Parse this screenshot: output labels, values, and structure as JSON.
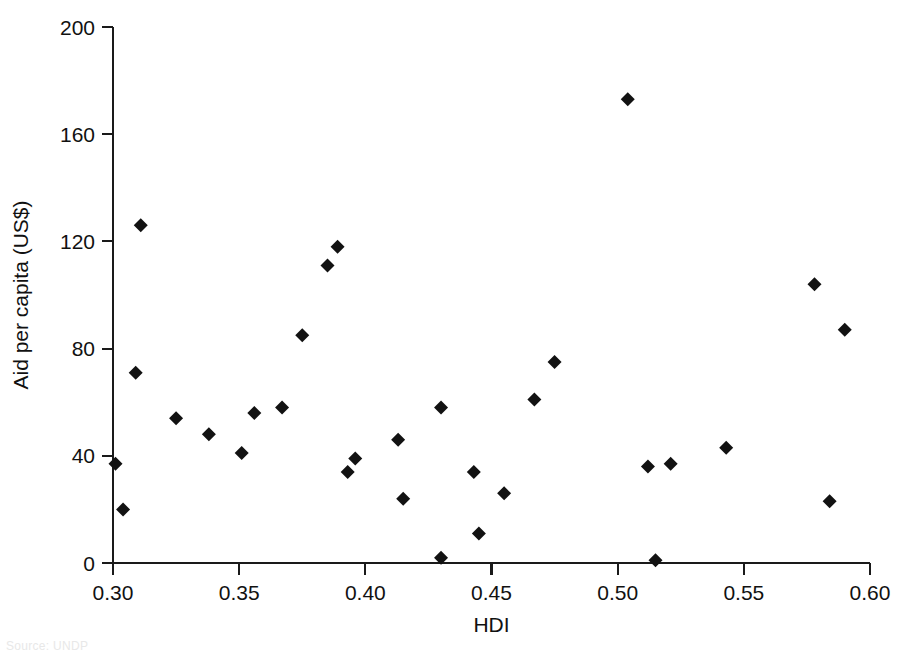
{
  "figure": {
    "background_color": "#ffffff",
    "marker_color": "#121212",
    "axis_color": "#1a1a1a",
    "width": 909,
    "height": 654
  },
  "source_note": "Source: UNDP",
  "chart_data": {
    "type": "scatter",
    "title": "",
    "subtitle": "",
    "xlabel": "HDI",
    "ylabel": "Aid per capita (US$)",
    "xlim": [
      0.3,
      0.6
    ],
    "ylim": [
      0,
      200
    ],
    "xticks": [
      0.3,
      0.35,
      0.4,
      0.45,
      0.5,
      0.55,
      0.6
    ],
    "xtick_labels": [
      "0.30",
      "0.35",
      "0.40",
      "0.45",
      "0.50",
      "0.55",
      "0.60"
    ],
    "yticks": [
      0,
      40,
      80,
      120,
      160,
      200
    ],
    "ytick_labels": [
      "0",
      "40",
      "80",
      "120",
      "160",
      "200"
    ],
    "grid": false,
    "legend": null,
    "marker_shape": "diamond",
    "marker_size": 13,
    "annotations": [],
    "x": [
      0.301,
      0.304,
      0.309,
      0.311,
      0.325,
      0.338,
      0.351,
      0.356,
      0.367,
      0.375,
      0.385,
      0.389,
      0.393,
      0.396,
      0.413,
      0.415,
      0.43,
      0.43,
      0.443,
      0.445,
      0.455,
      0.467,
      0.475,
      0.504,
      0.512,
      0.515,
      0.521,
      0.543,
      0.578,
      0.584,
      0.59
    ],
    "y": [
      37,
      20,
      71,
      126,
      54,
      48,
      41,
      56,
      58,
      85,
      111,
      118,
      34,
      39,
      46,
      24,
      58,
      2,
      34,
      11,
      26,
      61,
      75,
      173,
      36,
      1,
      37,
      43,
      104,
      23,
      87
    ],
    "points": [
      {
        "x": 0.301,
        "y": 37
      },
      {
        "x": 0.304,
        "y": 20
      },
      {
        "x": 0.309,
        "y": 71
      },
      {
        "x": 0.311,
        "y": 126
      },
      {
        "x": 0.325,
        "y": 54
      },
      {
        "x": 0.338,
        "y": 48
      },
      {
        "x": 0.351,
        "y": 41
      },
      {
        "x": 0.356,
        "y": 56
      },
      {
        "x": 0.367,
        "y": 58
      },
      {
        "x": 0.375,
        "y": 85
      },
      {
        "x": 0.385,
        "y": 111
      },
      {
        "x": 0.389,
        "y": 118
      },
      {
        "x": 0.393,
        "y": 34
      },
      {
        "x": 0.396,
        "y": 39
      },
      {
        "x": 0.413,
        "y": 46
      },
      {
        "x": 0.415,
        "y": 24
      },
      {
        "x": 0.43,
        "y": 58
      },
      {
        "x": 0.43,
        "y": 2
      },
      {
        "x": 0.443,
        "y": 34
      },
      {
        "x": 0.445,
        "y": 11
      },
      {
        "x": 0.455,
        "y": 26
      },
      {
        "x": 0.467,
        "y": 61
      },
      {
        "x": 0.475,
        "y": 75
      },
      {
        "x": 0.504,
        "y": 173
      },
      {
        "x": 0.512,
        "y": 36
      },
      {
        "x": 0.515,
        "y": 1
      },
      {
        "x": 0.521,
        "y": 37
      },
      {
        "x": 0.543,
        "y": 43
      },
      {
        "x": 0.578,
        "y": 104
      },
      {
        "x": 0.584,
        "y": 23
      },
      {
        "x": 0.59,
        "y": 87
      }
    ]
  }
}
